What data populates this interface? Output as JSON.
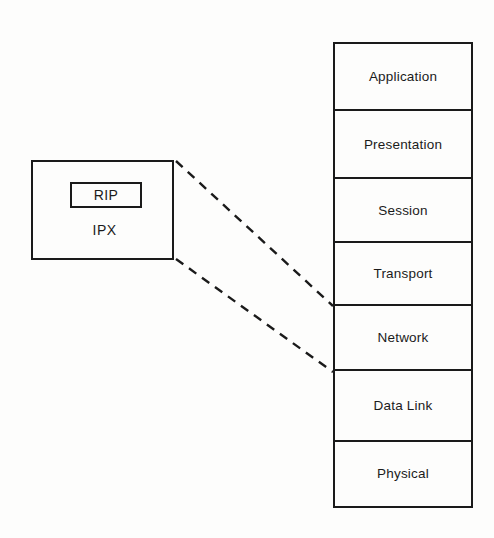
{
  "diagram": {
    "background_color": "#fdfdfc",
    "line_color": "#1a1a1a",
    "text_color": "#1b1b1b",
    "protocol_box": {
      "name": "IPX stack box",
      "inner_label": "RIP",
      "outer_label": "IPX"
    },
    "osi_stack": {
      "name": "OSI seven layer model",
      "layers": [
        {
          "label": "Application"
        },
        {
          "label": "Presentation"
        },
        {
          "label": "Session"
        },
        {
          "label": "Transport"
        },
        {
          "label": "Network"
        },
        {
          "label": "Data Link"
        },
        {
          "label": "Physical"
        }
      ]
    },
    "connectors": [
      {
        "name": "upper-dashed-connector",
        "from": "protocol-box top-right",
        "to": "network-layer top edge",
        "style": "dashed"
      },
      {
        "name": "lower-dashed-connector",
        "from": "protocol-box bottom-right",
        "to": "network-layer bottom edge",
        "style": "dashed"
      }
    ]
  }
}
